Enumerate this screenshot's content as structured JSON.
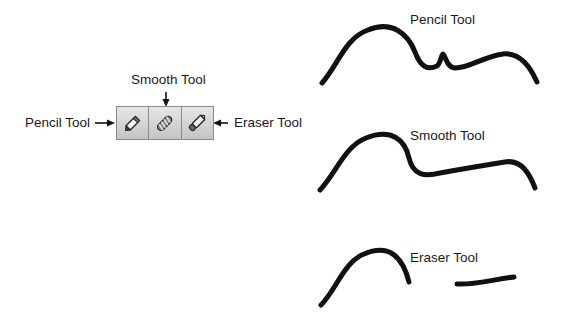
{
  "toolbar": {
    "tools": [
      {
        "name": "Pencil Tool",
        "icon": "pencil-icon"
      },
      {
        "name": "Smooth Tool",
        "icon": "smooth-icon"
      },
      {
        "name": "Eraser Tool",
        "icon": "eraser-icon"
      }
    ]
  },
  "callouts": {
    "pencil": "Pencil Tool",
    "smooth": "Smooth Tool",
    "eraser": "Eraser Tool"
  },
  "examples": {
    "pencil": "Pencil Tool",
    "smooth": "Smooth Tool",
    "eraser": "Eraser Tool"
  },
  "colors": {
    "stroke": "#111111",
    "toolbar_bg": "#d4d4d4",
    "toolbar_border": "#8a8a8a"
  }
}
